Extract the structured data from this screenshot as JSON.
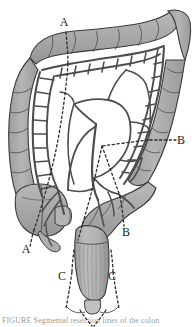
{
  "figure": {
    "subject": "colon",
    "style": "grayscale line drawing"
  },
  "colors": {
    "bowel_fill": "#a9a9a9",
    "bowel_fill_light": "#c2c2c2",
    "bowel_fill_dark": "#949494",
    "outline": "#3a3a3a",
    "vessel": "#4d4d4d",
    "vessel_light": "#6e6e6e",
    "label_text": "#1d1d1d",
    "dotted_line": "#2b2b2b",
    "background": "#ffffff",
    "caption_text": "#4a4a4a"
  },
  "labels": [
    {
      "id": "label-a-top",
      "text": "A",
      "x": 64,
      "y": 26
    },
    {
      "id": "label-a-bottom",
      "text": "A",
      "x": 26,
      "y": 253
    },
    {
      "id": "label-b-right",
      "text": "B",
      "x": 181,
      "y": 142
    },
    {
      "id": "label-b-lower",
      "text": "B",
      "x": 124,
      "y": 234
    },
    {
      "id": "label-c-left",
      "text": "C",
      "x": 64,
      "y": 278
    },
    {
      "id": "label-c-right",
      "text": "C",
      "x": 111,
      "y": 278
    }
  ],
  "caption": {
    "text": "FIGURE   Segmental resection lines of the colon",
    "visible_fragment": true
  },
  "regions": [
    {
      "name": "transverse-colon"
    },
    {
      "name": "ascending-colon"
    },
    {
      "name": "descending-colon"
    },
    {
      "name": "cecum"
    },
    {
      "name": "appendix"
    },
    {
      "name": "sigmoid-colon"
    },
    {
      "name": "rectum"
    },
    {
      "name": "anal-canal"
    },
    {
      "name": "hepatic-flexure"
    },
    {
      "name": "splenic-flexure"
    },
    {
      "name": "marginal-artery-arcade"
    },
    {
      "name": "vasa-recta"
    },
    {
      "name": "superior-mesenteric-artery"
    },
    {
      "name": "inferior-mesenteric-artery"
    }
  ]
}
